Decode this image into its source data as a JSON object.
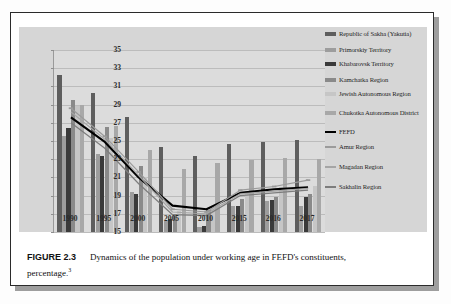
{
  "figure": {
    "label": "FIGURE 2.3",
    "caption_line1": "Dynamics of the population under working age in FEFD's constituents,",
    "caption_line2": "percentage.",
    "footnote_marker": "3"
  },
  "legend": {
    "items": [
      {
        "label": "Republic of Sakha (Yakutia)",
        "color": "#5e5e5e",
        "kind": "bar"
      },
      {
        "label": "Primorskiy Territory",
        "color": "#9d9d9d",
        "kind": "bar"
      },
      {
        "label": "Khabarovsk Territory",
        "color": "#3a3a3a",
        "kind": "bar"
      },
      {
        "label": "Kamchatka Region",
        "color": "#8a8a8a",
        "kind": "bar"
      },
      {
        "label": "Jewish Autonomous Region",
        "color": "#c6c6c6",
        "kind": "bar"
      },
      {
        "label": "Chukotka Autonomous District",
        "color": "#a8a8a8",
        "kind": "bar"
      },
      {
        "label": "FEFD",
        "color": "#000000",
        "kind": "line"
      },
      {
        "label": "Amur Region",
        "color": "#9b9b9b",
        "kind": "line"
      },
      {
        "label": "Magadan Region",
        "color": "#a5a5a5",
        "kind": "line"
      },
      {
        "label": "Sakhalin Region",
        "color": "#7d7d7d",
        "kind": "line"
      }
    ]
  },
  "chart_data": {
    "type": "bar",
    "title": "",
    "xlabel": "",
    "ylabel": "",
    "ylim": [
      15,
      35
    ],
    "yticks": [
      15,
      17,
      19,
      21,
      23,
      25,
      27,
      29,
      31,
      33,
      35
    ],
    "grid": true,
    "legend_position": "right",
    "categories": [
      "1990",
      "1995",
      "2000",
      "2005",
      "2010",
      "2015",
      "2016",
      "2017"
    ],
    "bar_series": [
      {
        "name": "Republic of Sakha (Yakutia)",
        "color": "#5e5e5e",
        "values": [
          32.2,
          30.3,
          27.6,
          24.3,
          23.4,
          24.7,
          24.9,
          25.1
        ]
      },
      {
        "name": "Primorskiy Territory",
        "color": "#9d9d9d",
        "values": [
          25.6,
          23.6,
          19.4,
          16.2,
          15.6,
          17.9,
          18.4,
          17.9
        ]
      },
      {
        "name": "Khabarovsk Territory",
        "color": "#3a3a3a",
        "values": [
          26.4,
          23.3,
          19.2,
          16.4,
          15.7,
          17.9,
          18.5,
          18.9
        ]
      },
      {
        "name": "Kamchatka Region",
        "color": "#8a8a8a",
        "values": [
          29.5,
          26.5,
          22.2,
          17.0,
          17.4,
          18.6,
          18.9,
          19.2
        ]
      },
      {
        "name": "Jewish Autonomous Region",
        "color": "#c6c6c6",
        "values": [
          28.8,
          25.3,
          21.0,
          17.3,
          17.8,
          19.5,
          19.9,
          20.1
        ]
      },
      {
        "name": "Chukotka Autonomous District",
        "color": "#a8a8a8",
        "values": [
          29.0,
          26.6,
          24.0,
          21.9,
          22.6,
          22.9,
          23.1,
          23.0
        ]
      }
    ],
    "line_series": [
      {
        "name": "FEFD",
        "color": "#000000",
        "width": 2.1,
        "marker": "none",
        "values": [
          27.6,
          24.9,
          21.0,
          17.9,
          17.5,
          19.3,
          19.7,
          19.9
        ]
      },
      {
        "name": "Amur Region",
        "color": "#9b9b9b",
        "width": 1.2,
        "marker": "dash",
        "values": [
          28.6,
          25.5,
          21.6,
          17.5,
          17.2,
          19.6,
          20.0,
          20.7
        ]
      },
      {
        "name": "Magadan Region",
        "color": "#a5a5a5",
        "width": 1.2,
        "marker": "none",
        "values": [
          28.2,
          25.2,
          21.2,
          17.2,
          17.0,
          19.2,
          19.5,
          19.8
        ]
      },
      {
        "name": "Sakhalin Region",
        "color": "#7d7d7d",
        "width": 1.2,
        "marker": "none",
        "values": [
          27.0,
          24.2,
          20.3,
          16.9,
          16.8,
          19.0,
          19.3,
          19.6
        ]
      }
    ]
  }
}
